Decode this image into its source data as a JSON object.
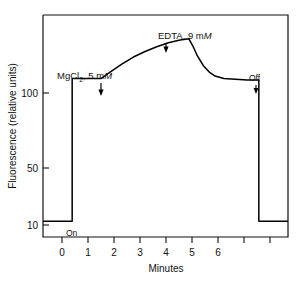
{
  "figure": {
    "background_color": "#ffffff",
    "line_color": "#000000"
  },
  "chart_data": {
    "type": "line",
    "title": "",
    "xlabel": "Minutes",
    "ylabel": "Fluorescence (relative units)",
    "xlim": [
      -1.0,
      7.4
    ],
    "ylim": [
      0,
      140
    ],
    "grid": false,
    "legend": null,
    "x_ticks": [
      0,
      1,
      2,
      3,
      4,
      5,
      6,
      7
    ],
    "x_tick_labels": [
      "0",
      "1",
      "2",
      "3",
      "4",
      "5",
      "6",
      ""
    ],
    "y_ticks": [
      10,
      50,
      100
    ],
    "y_tick_labels": [
      "10",
      "50",
      "100"
    ],
    "series": [
      {
        "name": "Fluorescence trace",
        "x": [
          -1.0,
          0.0,
          0.0,
          1.0,
          1.3,
          1.7,
          2.1,
          2.5,
          2.9,
          3.3,
          3.7,
          4.0,
          4.0,
          4.15,
          4.3,
          4.5,
          4.7,
          4.9,
          5.2,
          5.6,
          6.0,
          6.4,
          6.4,
          7.4
        ],
        "y": [
          10,
          10,
          100,
          100,
          104,
          109,
          113.5,
          117,
          120,
          122.5,
          124.2,
          125,
          125,
          120,
          114,
          108,
          104,
          101.5,
          100,
          99.5,
          99,
          99,
          10,
          10
        ]
      }
    ],
    "annotations": [
      {
        "id": "mgcl2",
        "label": "MgCl2, 5 mM",
        "label_parts": {
          "prefix": "MgCl",
          "subscript": "2",
          "middle": ", 5 m",
          "italic": "M"
        },
        "x": 1.0,
        "y": 100,
        "text_x": 0.55,
        "text_y": 112,
        "arrow": "down"
      },
      {
        "id": "edta",
        "label": "EDTA, 9 mM",
        "label_parts": {
          "prefix": "EDTA, 9 m",
          "subscript": "",
          "middle": "",
          "italic": "M"
        },
        "x": 4.0,
        "y": 125,
        "text_x": 3.55,
        "text_y": 137,
        "arrow": "down"
      },
      {
        "id": "off",
        "label": "Off",
        "x": 6.4,
        "y": 99,
        "text_x": 6.15,
        "text_y": 110,
        "arrow": "down"
      },
      {
        "id": "on",
        "label": "On",
        "x": 0.0,
        "y": 10,
        "text_x": 0.12,
        "text_y": 5,
        "arrow": "none"
      }
    ]
  }
}
